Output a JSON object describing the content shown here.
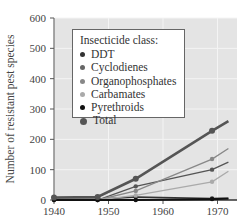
{
  "chart_data": {
    "type": "line",
    "title": "",
    "xlabel": "",
    "ylabel": "Number of resistant pest species",
    "xlim": [
      1940,
      1972
    ],
    "ylim": [
      0,
      600
    ],
    "xticks": [
      "1940",
      "1950",
      "1960",
      "1970"
    ],
    "yticks": [
      "0",
      "100",
      "200",
      "300",
      "400",
      "500",
      "600"
    ],
    "grid": true,
    "legend_position": "upper left (inset)",
    "legend_title": "Insecticide class:",
    "x": [
      1940,
      1948,
      1955,
      1969,
      1972
    ],
    "series": [
      {
        "name": "DDT",
        "color": "#333333",
        "values": [
          2,
          3,
          10,
          5,
          5
        ]
      },
      {
        "name": "Cyclodienes",
        "color": "#555555",
        "values": [
          0,
          0,
          45,
          100,
          125
        ]
      },
      {
        "name": "Organophosphates",
        "color": "#888888",
        "values": [
          0,
          0,
          30,
          135,
          170
        ]
      },
      {
        "name": "Carbamates",
        "color": "#aaaaaa",
        "values": [
          0,
          0,
          15,
          60,
          95
        ]
      },
      {
        "name": "Pyrethroids",
        "color": "#111111",
        "values": [
          0,
          0,
          0,
          3,
          5
        ]
      },
      {
        "name": "Total",
        "color": "#555555",
        "values": [
          8,
          10,
          70,
          228,
          260
        ]
      }
    ]
  },
  "legend": {
    "title": "Insecticide class:",
    "items": [
      {
        "label": "DDT",
        "color": "#333333",
        "size": 5
      },
      {
        "label": "Cyclodienes",
        "color": "#666666",
        "size": 5
      },
      {
        "label": "Organophosphates",
        "color": "#888888",
        "size": 5
      },
      {
        "label": "Carbamates",
        "color": "#aaaaaa",
        "size": 5
      },
      {
        "label": "Pyrethroids",
        "color": "#111111",
        "size": 5
      },
      {
        "label": "Total",
        "color": "#555555",
        "size": 7
      }
    ]
  },
  "axis": {
    "y_label": "Number of resistant pest species",
    "y_ticks": [
      "0",
      "100",
      "200",
      "300",
      "400",
      "500",
      "600"
    ],
    "x_ticks": [
      "1940",
      "1950",
      "1960",
      "1970"
    ]
  }
}
